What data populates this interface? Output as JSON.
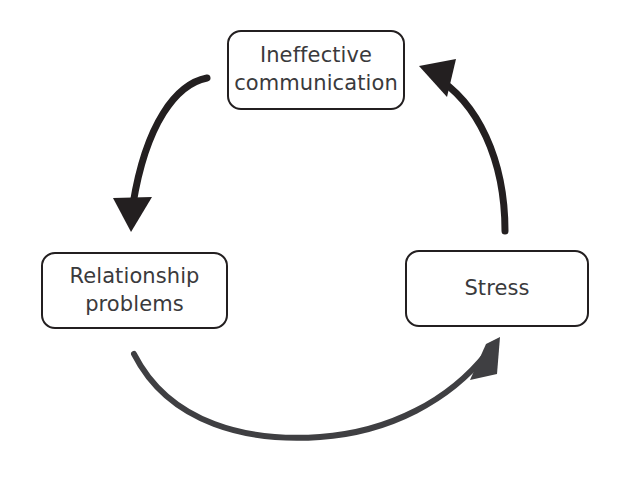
{
  "diagram": {
    "type": "cycle-diagram",
    "background_color": "#ffffff",
    "box_border_color": "#231f20",
    "text_color": "#3a3a3c",
    "arrow_color": "#3f3f42",
    "nodes": [
      {
        "id": "ineffective-communication",
        "label": "Ineffective\ncommunication",
        "position": "top"
      },
      {
        "id": "relationship-problems",
        "label": "Relationship\nproblems",
        "position": "bottom-left"
      },
      {
        "id": "stress",
        "label": "Stress",
        "position": "bottom-right"
      }
    ],
    "arrows": [
      {
        "id": "arrow-ineffective-to-relationship",
        "from": "ineffective-communication",
        "to": "relationship-problems",
        "direction": "down-left"
      },
      {
        "id": "arrow-relationship-to-stress",
        "from": "relationship-problems",
        "to": "stress",
        "direction": "right-up"
      },
      {
        "id": "arrow-stress-to-ineffective",
        "from": "stress",
        "to": "ineffective-communication",
        "direction": "up-left"
      }
    ]
  }
}
